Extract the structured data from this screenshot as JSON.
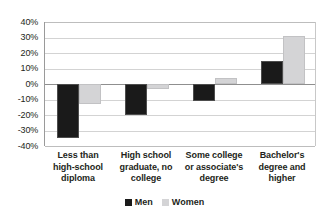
{
  "chart_data": {
    "type": "bar",
    "title": "",
    "subtitle": "",
    "xlabel": "",
    "ylabel": "",
    "ylim": [
      -40,
      40
    ],
    "ytick_labels": [
      "40%",
      "30%",
      "20%",
      "10%",
      "0%",
      "-10%",
      "-20%",
      "-30%",
      "-40%"
    ],
    "ytick_values": [
      40,
      30,
      20,
      10,
      0,
      -10,
      -20,
      -30,
      -40
    ],
    "grid": true,
    "legend_position": "bottom-center",
    "categories": [
      "Less than high-school diploma",
      "High school graduate, no college",
      "Some college or associate's degree",
      "Bachelor's degree and higher"
    ],
    "category_lines": [
      [
        "Less than",
        "high-school",
        "diploma"
      ],
      [
        "High school",
        "graduate, no",
        "college"
      ],
      [
        "Some college",
        "or associate's",
        "degree"
      ],
      [
        "Bachelor's",
        "degree and",
        "higher"
      ]
    ],
    "series": [
      {
        "name": "Men",
        "color": "#1a1a1a",
        "values": [
          -35,
          -20,
          -11,
          15
        ]
      },
      {
        "name": "Women",
        "color": "#d4d4d6",
        "values": [
          -13,
          -3,
          4,
          31
        ]
      }
    ]
  },
  "legend": {
    "men_label": "Men",
    "women_label": "Women"
  },
  "yticks": {
    "t0": "40%",
    "t1": "30%",
    "t2": "20%",
    "t3": "10%",
    "t4": "0%",
    "t5": "-10%",
    "t6": "-20%",
    "t7": "-30%",
    "t8": "-40%"
  },
  "categories_text": {
    "c0l0": "Less than",
    "c0l1": "high-school",
    "c0l2": "diploma",
    "c1l0": "High school",
    "c1l1": "graduate, no",
    "c1l2": "college",
    "c2l0": "Some college",
    "c2l1": "or associate's",
    "c2l2": "degree",
    "c3l0": "Bachelor's",
    "c3l1": "degree and",
    "c3l2": "higher"
  }
}
